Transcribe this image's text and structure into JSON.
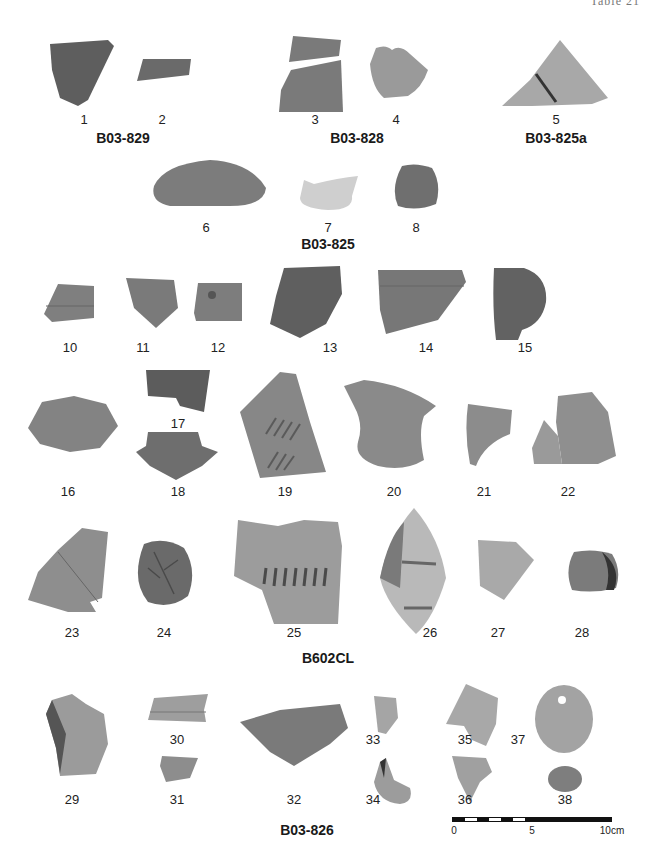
{
  "page": {
    "header_text": "Table 21",
    "background": "#ffffff"
  },
  "groups": [
    {
      "label": "B03-829",
      "items": [
        "1",
        "2"
      ]
    },
    {
      "label": "B03-828",
      "items": [
        "3",
        "4"
      ]
    },
    {
      "label": "B03-825a",
      "items": [
        "5"
      ]
    },
    {
      "label": "B03-825",
      "items": [
        "6",
        "7",
        "8"
      ]
    },
    {
      "label": "B602CL",
      "items": [
        "10",
        "11",
        "12",
        "13",
        "14",
        "15",
        "16",
        "17",
        "18",
        "19",
        "20",
        "21",
        "22",
        "23",
        "24",
        "25",
        "26",
        "27",
        "28"
      ]
    },
    {
      "label": "B03-826",
      "items": [
        "29",
        "30",
        "31",
        "32",
        "33",
        "34",
        "35",
        "36",
        "37",
        "38"
      ]
    }
  ],
  "artifacts": {
    "a1": {
      "number": "1",
      "tone": "#5e5e5e"
    },
    "a2": {
      "number": "2",
      "tone": "#6a6a6a"
    },
    "a3": {
      "number": "3",
      "tone": "#7a7a7a"
    },
    "a4": {
      "number": "4",
      "tone": "#9a9a9a"
    },
    "a5": {
      "number": "5",
      "tone": "#a8a8a8"
    },
    "a6": {
      "number": "6",
      "tone": "#7c7c7c"
    },
    "a7": {
      "number": "7",
      "tone": "#cfcfcf"
    },
    "a8": {
      "number": "8",
      "tone": "#6f6f6f"
    },
    "a10": {
      "number": "10",
      "tone": "#7f7f7f"
    },
    "a11": {
      "number": "11",
      "tone": "#7a7a7a"
    },
    "a12": {
      "number": "12",
      "tone": "#7d7d7d"
    },
    "a13": {
      "number": "13",
      "tone": "#5f5f5f"
    },
    "a14": {
      "number": "14",
      "tone": "#777777"
    },
    "a15": {
      "number": "15",
      "tone": "#626262"
    },
    "a16": {
      "number": "16",
      "tone": "#838383"
    },
    "a17": {
      "number": "17",
      "tone": "#5c5c5c"
    },
    "a18": {
      "number": "18",
      "tone": "#6e6e6e"
    },
    "a19": {
      "number": "19",
      "tone": "#878787"
    },
    "a20": {
      "number": "20",
      "tone": "#8a8a8a"
    },
    "a21": {
      "number": "21",
      "tone": "#8c8c8c"
    },
    "a22": {
      "number": "22",
      "tone": "#8f8f8f"
    },
    "a23": {
      "number": "23",
      "tone": "#8e8e8e"
    },
    "a24": {
      "number": "24",
      "tone": "#6a6a6a"
    },
    "a25": {
      "number": "25",
      "tone": "#9c9c9c"
    },
    "a26": {
      "number": "26",
      "tone": "#b9b9b9"
    },
    "a27": {
      "number": "27",
      "tone": "#a9a9a9"
    },
    "a28": {
      "number": "28",
      "tone": "#7b7b7b"
    },
    "a29": {
      "number": "29",
      "tone": "#9b9b9b"
    },
    "a30": {
      "number": "30",
      "tone": "#9e9e9e"
    },
    "a31": {
      "number": "31",
      "tone": "#8d8d8d"
    },
    "a32": {
      "number": "32",
      "tone": "#7a7a7a"
    },
    "a33": {
      "number": "33",
      "tone": "#a5a5a5"
    },
    "a34": {
      "number": "34",
      "tone": "#9c9c9c"
    },
    "a35": {
      "number": "35",
      "tone": "#a8a8a8"
    },
    "a36": {
      "number": "36",
      "tone": "#a0a0a0"
    },
    "a37": {
      "number": "37",
      "tone": "#a3a3a3"
    },
    "a38": {
      "number": "38",
      "tone": "#7e7e7e"
    }
  },
  "scale_bar": {
    "labels": [
      "0",
      "5",
      "10cm"
    ]
  }
}
